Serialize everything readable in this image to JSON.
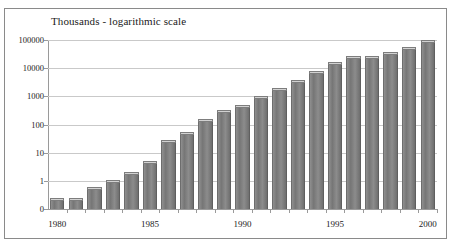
{
  "chart_data": {
    "type": "bar",
    "title": "Thousands - logarithmic scale",
    "xlabel": "",
    "ylabel": "",
    "scale": "log",
    "grid": true,
    "legend": null,
    "ylim": [
      0.1,
      100000
    ],
    "ytick_labels": [
      "100000",
      "10000",
      "1000",
      "100",
      "10",
      "1",
      "0"
    ],
    "ytick_values": [
      100000,
      10000,
      1000,
      100,
      10,
      1,
      0
    ],
    "xtick_labels": [
      "1980",
      "1985",
      "1990",
      "1995",
      "2000"
    ],
    "xtick_values": [
      1980,
      1985,
      1990,
      1995,
      2000
    ],
    "categories": [
      "1980",
      "1981",
      "1982",
      "1983",
      "1984",
      "1985",
      "1986",
      "1987",
      "1988",
      "1989",
      "1990",
      "1991",
      "1992",
      "1993",
      "1994",
      "1995",
      "1996",
      "1997",
      "1998",
      "1999",
      "2000"
    ],
    "values": [
      0.25,
      0.25,
      0.6,
      1.1,
      2.0,
      5.0,
      28,
      56,
      160,
      330,
      500,
      1000,
      2000,
      3800,
      8000,
      16000,
      26000,
      28000,
      38000,
      56000,
      100000
    ]
  },
  "colors": {
    "bar_fill": "#808080",
    "bar_cap": "#d2d2d2",
    "gridline": "#c9c9c9",
    "axis": "#9a9a9a",
    "border": "#8a8a8a",
    "text": "#1a1a1a",
    "background": "#ffffff"
  }
}
